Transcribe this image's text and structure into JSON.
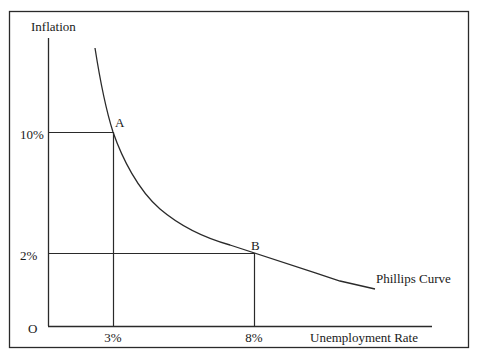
{
  "diagram": {
    "y_axis_label": "Inflation",
    "x_axis_label": "Unemployment Rate",
    "origin_label": "O",
    "curve_label": "Phillips Curve",
    "y_ticks": [
      {
        "label": "10%",
        "value": 10
      },
      {
        "label": "2%",
        "value": 2
      }
    ],
    "x_ticks": [
      {
        "label": "3%",
        "value": 3
      },
      {
        "label": "8%",
        "value": 8
      }
    ],
    "points": [
      {
        "name": "A",
        "unemployment": 3,
        "inflation": 10
      },
      {
        "name": "B",
        "unemployment": 8,
        "inflation": 2
      }
    ],
    "colors": {
      "line": "#2a2a2a",
      "border": "#2a2a2a",
      "background": "#ffffff"
    }
  }
}
